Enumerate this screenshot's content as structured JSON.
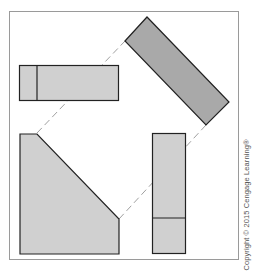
{
  "figure": {
    "type": "orthographic-projection-diagram",
    "frame": {
      "x": 9,
      "y": 11,
      "width": 229,
      "height": 248,
      "stroke": "#999999"
    },
    "colors": {
      "view_fill": "#d0d0d0",
      "auxiliary_fill": "#a9a9a9",
      "outline": "#222222",
      "projection_line": "#a0a0a0"
    },
    "views": [
      {
        "name": "top-view",
        "shape": "rectangle",
        "x": 19,
        "y": 65,
        "width": 99,
        "height": 35,
        "divider_x": 37
      },
      {
        "name": "auxiliary-view",
        "shape": "rotated-rectangle",
        "points": [
          [
            125,
            41
          ],
          [
            147,
            17
          ],
          [
            229,
            102
          ],
          [
            206,
            125
          ]
        ]
      },
      {
        "name": "front-view",
        "shape": "pentagon",
        "points": [
          [
            20,
            134
          ],
          [
            37,
            134
          ],
          [
            119,
            219
          ],
          [
            119,
            254
          ],
          [
            20,
            254
          ]
        ]
      },
      {
        "name": "side-view",
        "shape": "rectangle",
        "x": 152,
        "y": 133,
        "width": 33,
        "height": 120,
        "divider_y": 218
      }
    ],
    "projection_lines": [
      {
        "from": [
          37,
          133
        ],
        "to": [
          125,
          41
        ]
      },
      {
        "from": [
          119,
          219
        ],
        "to": [
          206,
          125
        ]
      }
    ],
    "copyright": "Copyright © 2015 Cengage Learning®"
  }
}
